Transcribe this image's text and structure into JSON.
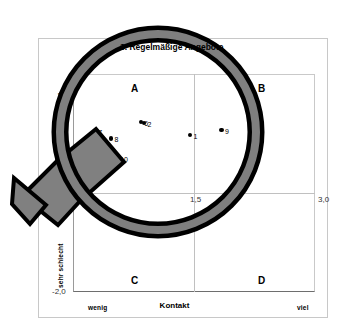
{
  "chart_data": {
    "type": "scatter",
    "title": "3. Regelmäßige Angebote",
    "xlabel": "Kontakt",
    "ylabel": "Eindruck",
    "xlim": [
      0,
      3.0
    ],
    "ylim": [
      -2.0,
      2.0
    ],
    "grid": true,
    "legend": "none",
    "x_tick_labels": [
      "0",
      "1,5",
      "3,0"
    ],
    "y_tick_labels": [
      "-2,0"
    ],
    "x_axis_low_label": "wenig",
    "x_axis_high_label": "viel",
    "y_axis_high_label": "sehr gut",
    "y_axis_low_label": "sehr schlecht",
    "quadrants": [
      {
        "id": "A",
        "label": "A",
        "position": "top-left"
      },
      {
        "id": "B",
        "label": "B",
        "position": "top-right"
      },
      {
        "id": "C",
        "label": "C",
        "position": "bottom-left"
      },
      {
        "id": "D",
        "label": "D",
        "position": "bottom-right"
      }
    ],
    "points": [
      {
        "label": "1",
        "x": 1.45,
        "y": 0.88
      },
      {
        "label": "2",
        "x": 0.88,
        "y": 1.1
      },
      {
        "label": "6",
        "x": 0.84,
        "y": 1.12
      },
      {
        "label": "7",
        "x": 0.27,
        "y": 0.95
      },
      {
        "label": "4",
        "x": 0.25,
        "y": 0.86
      },
      {
        "label": "8",
        "x": 0.47,
        "y": 0.82
      },
      {
        "label": "5",
        "x": 0.08,
        "y": 0.57
      },
      {
        "label": "3",
        "x": 0.24,
        "y": 0.57
      },
      {
        "label": "9",
        "x": 0.27,
        "y": 0.56
      },
      {
        "label": "10",
        "x": 0.54,
        "y": 0.46
      },
      {
        "label": "9",
        "x": 1.84,
        "y": 0.97
      }
    ]
  },
  "overlay": {
    "magnifier_name": "magnifying-glass",
    "ring_color": "#000000",
    "ring_fill": "#7f7f7f",
    "handle_color": "#7f7f7f"
  }
}
